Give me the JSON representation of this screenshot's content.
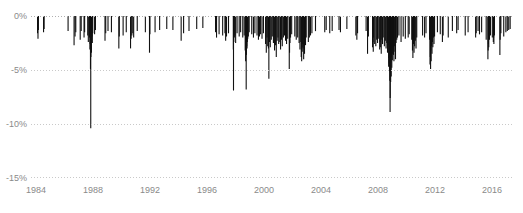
{
  "chart_data": {
    "type": "bar",
    "title": "",
    "subtitle": "",
    "xlabel": "",
    "ylabel": "",
    "xlim": [
      1983.6,
      2017.4
    ],
    "ylim": [
      -15,
      0
    ],
    "grid": true,
    "legend_position": "none",
    "orientation": "downward-spikes",
    "series_name": "Daily negative return",
    "y_ticks": [
      {
        "value": 0,
        "label": "0%"
      },
      {
        "value": -5,
        "label": "-5%"
      },
      {
        "value": -10,
        "label": "-10%"
      },
      {
        "value": -15,
        "label": "-15%"
      }
    ],
    "x_ticks": [
      {
        "value": 1984,
        "label": "1984"
      },
      {
        "value": 1988,
        "label": "1988"
      },
      {
        "value": 1992,
        "label": "1992"
      },
      {
        "value": 1996,
        "label": "1996"
      },
      {
        "value": 2000,
        "label": "2000"
      },
      {
        "value": 2004,
        "label": "2004"
      },
      {
        "value": 2008,
        "label": "2008"
      },
      {
        "value": 2012,
        "label": "2012"
      },
      {
        "value": 2016,
        "label": "2016"
      }
    ],
    "series_color": "#111111",
    "grid_color": "#c9c9c9",
    "axis_text_color": "#8a8a8a",
    "background_color": "#ffffff",
    "notable_events": [
      {
        "x": 1987.8,
        "y": -10.4,
        "label": "Black Monday 1987"
      },
      {
        "x": 2008.78,
        "y": -8.9,
        "label": "2008 financial crisis"
      }
    ],
    "points": [
      [
        1984.06,
        -1.6
      ],
      [
        1984.09,
        -2.1
      ],
      [
        1984.12,
        -1.3
      ],
      [
        1984.48,
        -1.5
      ],
      [
        1984.52,
        -1.2
      ],
      [
        1986.2,
        -1.4
      ],
      [
        1986.62,
        -2.7
      ],
      [
        1986.69,
        -1.9
      ],
      [
        1986.74,
        -1.5
      ],
      [
        1987.05,
        -2.2
      ],
      [
        1987.12,
        -1.4
      ],
      [
        1987.32,
        -2.0
      ],
      [
        1987.36,
        -1.5
      ],
      [
        1987.58,
        -1.8
      ],
      [
        1987.62,
        -2.4
      ],
      [
        1987.7,
        -2.0
      ],
      [
        1987.73,
        -3.1
      ],
      [
        1987.75,
        -2.6
      ],
      [
        1987.77,
        -4.9
      ],
      [
        1987.79,
        -10.4
      ],
      [
        1987.8,
        -3.8
      ],
      [
        1987.82,
        -2.9
      ],
      [
        1987.84,
        -3.4
      ],
      [
        1987.86,
        -2.2
      ],
      [
        1987.88,
        -1.9
      ],
      [
        1987.9,
        -2.5
      ],
      [
        1987.93,
        -1.6
      ],
      [
        1988.06,
        -1.7
      ],
      [
        1988.12,
        -1.3
      ],
      [
        1988.79,
        -2.3
      ],
      [
        1988.84,
        -1.6
      ],
      [
        1989.0,
        -1.4
      ],
      [
        1989.24,
        -1.5
      ],
      [
        1989.76,
        -3.0
      ],
      [
        1989.79,
        -1.9
      ],
      [
        1990.06,
        -1.8
      ],
      [
        1990.28,
        -1.5
      ],
      [
        1990.58,
        -3.0
      ],
      [
        1990.62,
        -2.1
      ],
      [
        1990.67,
        -1.8
      ],
      [
        1990.74,
        -1.6
      ],
      [
        1990.8,
        -2.0
      ],
      [
        1991.05,
        -1.4
      ],
      [
        1991.62,
        -1.5
      ],
      [
        1991.91,
        -3.4
      ],
      [
        1991.94,
        -1.7
      ],
      [
        1992.3,
        -1.5
      ],
      [
        1992.62,
        -1.3
      ],
      [
        1993.12,
        -1.2
      ],
      [
        1993.55,
        -1.3
      ],
      [
        1994.13,
        -2.3
      ],
      [
        1994.3,
        -1.6
      ],
      [
        1994.68,
        -1.4
      ],
      [
        1995.22,
        -1.2
      ],
      [
        1995.65,
        -1.1
      ],
      [
        1996.54,
        -1.5
      ],
      [
        1996.61,
        -2.0
      ],
      [
        1996.79,
        -1.7
      ],
      [
        1997.04,
        -1.8
      ],
      [
        1997.2,
        -1.6
      ],
      [
        1997.25,
        -2.3
      ],
      [
        1997.31,
        -1.9
      ],
      [
        1997.45,
        -1.6
      ],
      [
        1997.79,
        -3.1
      ],
      [
        1997.8,
        -6.9
      ],
      [
        1997.82,
        -2.4
      ],
      [
        1997.86,
        -2.0
      ],
      [
        1997.9,
        -1.8
      ],
      [
        1997.95,
        -2.5
      ],
      [
        1998.05,
        -1.6
      ],
      [
        1998.2,
        -1.9
      ],
      [
        1998.3,
        -1.5
      ],
      [
        1998.45,
        -2.0
      ],
      [
        1998.55,
        -1.8
      ],
      [
        1998.62,
        -3.2
      ],
      [
        1998.65,
        -4.2
      ],
      [
        1998.67,
        -2.5
      ],
      [
        1998.69,
        -6.8
      ],
      [
        1998.71,
        -3.6
      ],
      [
        1998.73,
        -2.8
      ],
      [
        1998.75,
        -3.0
      ],
      [
        1998.77,
        -2.4
      ],
      [
        1998.8,
        -2.1
      ],
      [
        1998.84,
        -1.9
      ],
      [
        1998.9,
        -1.5
      ],
      [
        1999.08,
        -1.7
      ],
      [
        1999.2,
        -2.0
      ],
      [
        1999.3,
        -1.6
      ],
      [
        1999.45,
        -1.8
      ],
      [
        1999.55,
        -2.2
      ],
      [
        1999.62,
        -1.9
      ],
      [
        1999.7,
        -1.7
      ],
      [
        1999.8,
        -2.1
      ],
      [
        1999.9,
        -1.6
      ],
      [
        2000.05,
        -2.6
      ],
      [
        2000.1,
        -3.4
      ],
      [
        2000.15,
        -2.0
      ],
      [
        2000.2,
        -2.8
      ],
      [
        2000.25,
        -3.0
      ],
      [
        2000.28,
        -5.8
      ],
      [
        2000.32,
        -2.4
      ],
      [
        2000.38,
        -2.9
      ],
      [
        2000.45,
        -2.2
      ],
      [
        2000.52,
        -1.9
      ],
      [
        2000.6,
        -2.5
      ],
      [
        2000.68,
        -3.2
      ],
      [
        2000.75,
        -2.7
      ],
      [
        2000.8,
        -3.8
      ],
      [
        2000.86,
        -2.3
      ],
      [
        2000.92,
        -2.0
      ],
      [
        2000.97,
        -2.6
      ],
      [
        2001.05,
        -2.4
      ],
      [
        2001.1,
        -3.1
      ],
      [
        2001.16,
        -2.2
      ],
      [
        2001.22,
        -2.8
      ],
      [
        2001.3,
        -2.0
      ],
      [
        2001.38,
        -1.8
      ],
      [
        2001.45,
        -2.3
      ],
      [
        2001.52,
        -2.6
      ],
      [
        2001.6,
        -2.1
      ],
      [
        2001.71,
        -4.9
      ],
      [
        2001.73,
        -3.4
      ],
      [
        2001.76,
        -2.5
      ],
      [
        2001.8,
        -2.0
      ],
      [
        2001.88,
        -1.7
      ],
      [
        2002.1,
        -1.9
      ],
      [
        2002.2,
        -2.2
      ],
      [
        2002.3,
        -2.0
      ],
      [
        2002.4,
        -2.5
      ],
      [
        2002.46,
        -3.1
      ],
      [
        2002.52,
        -2.4
      ],
      [
        2002.55,
        -3.8
      ],
      [
        2002.58,
        -4.2
      ],
      [
        2002.6,
        -2.9
      ],
      [
        2002.62,
        -3.3
      ],
      [
        2002.65,
        -2.6
      ],
      [
        2002.68,
        -3.0
      ],
      [
        2002.72,
        -4.0
      ],
      [
        2002.75,
        -2.8
      ],
      [
        2002.78,
        -3.5
      ],
      [
        2002.8,
        -2.2
      ],
      [
        2002.85,
        -2.7
      ],
      [
        2002.9,
        -2.0
      ],
      [
        2003.05,
        -2.4
      ],
      [
        2003.12,
        -2.0
      ],
      [
        2003.2,
        -1.8
      ],
      [
        2003.3,
        -1.6
      ],
      [
        2003.55,
        -1.4
      ],
      [
        2004.2,
        -1.5
      ],
      [
        2004.3,
        -1.3
      ],
      [
        2004.55,
        -1.6
      ],
      [
        2004.72,
        -1.4
      ],
      [
        2005.2,
        -1.3
      ],
      [
        2005.3,
        -1.5
      ],
      [
        2005.75,
        -1.2
      ],
      [
        2006.38,
        -1.8
      ],
      [
        2006.45,
        -2.2
      ],
      [
        2006.5,
        -1.6
      ],
      [
        2007.1,
        -1.4
      ],
      [
        2007.2,
        -3.5
      ],
      [
        2007.26,
        -1.9
      ],
      [
        2007.55,
        -2.9
      ],
      [
        2007.58,
        -2.4
      ],
      [
        2007.6,
        -3.3
      ],
      [
        2007.62,
        -2.0
      ],
      [
        2007.7,
        -2.6
      ],
      [
        2007.78,
        -2.8
      ],
      [
        2007.84,
        -2.2
      ],
      [
        2007.9,
        -2.5
      ],
      [
        2007.95,
        -2.1
      ],
      [
        2008.05,
        -3.1
      ],
      [
        2008.08,
        -2.4
      ],
      [
        2008.12,
        -2.9
      ],
      [
        2008.16,
        -3.5
      ],
      [
        2008.2,
        -2.2
      ],
      [
        2008.25,
        -2.6
      ],
      [
        2008.3,
        -2.0
      ],
      [
        2008.38,
        -2.8
      ],
      [
        2008.45,
        -2.3
      ],
      [
        2008.5,
        -3.0
      ],
      [
        2008.55,
        -2.5
      ],
      [
        2008.6,
        -3.4
      ],
      [
        2008.65,
        -2.7
      ],
      [
        2008.68,
        -4.7
      ],
      [
        2008.7,
        -3.9
      ],
      [
        2008.72,
        -4.4
      ],
      [
        2008.74,
        -5.1
      ],
      [
        2008.76,
        -6.0
      ],
      [
        2008.78,
        -8.9
      ],
      [
        2008.79,
        -7.6
      ],
      [
        2008.8,
        -5.2
      ],
      [
        2008.82,
        -6.1
      ],
      [
        2008.84,
        -4.3
      ],
      [
        2008.86,
        -5.6
      ],
      [
        2008.88,
        -3.8
      ],
      [
        2008.9,
        -4.8
      ],
      [
        2008.92,
        -3.2
      ],
      [
        2008.94,
        -4.1
      ],
      [
        2008.96,
        -3.5
      ],
      [
        2008.98,
        -2.9
      ],
      [
        2009.02,
        -3.6
      ],
      [
        2009.05,
        -4.2
      ],
      [
        2009.08,
        -2.8
      ],
      [
        2009.12,
        -3.3
      ],
      [
        2009.16,
        -4.0
      ],
      [
        2009.2,
        -2.5
      ],
      [
        2009.25,
        -2.2
      ],
      [
        2009.3,
        -2.0
      ],
      [
        2009.4,
        -1.8
      ],
      [
        2009.55,
        -2.4
      ],
      [
        2009.7,
        -1.9
      ],
      [
        2009.85,
        -2.1
      ],
      [
        2010.05,
        -2.0
      ],
      [
        2010.12,
        -1.7
      ],
      [
        2010.3,
        -2.2
      ],
      [
        2010.35,
        -3.2
      ],
      [
        2010.38,
        -3.9
      ],
      [
        2010.42,
        -2.6
      ],
      [
        2010.46,
        -3.4
      ],
      [
        2010.5,
        -2.8
      ],
      [
        2010.55,
        -2.3
      ],
      [
        2010.6,
        -3.0
      ],
      [
        2010.65,
        -2.0
      ],
      [
        2011.06,
        -1.8
      ],
      [
        2011.2,
        -2.0
      ],
      [
        2011.3,
        -1.6
      ],
      [
        2011.55,
        -2.2
      ],
      [
        2011.58,
        -4.5
      ],
      [
        2011.6,
        -3.8
      ],
      [
        2011.62,
        -4.9
      ],
      [
        2011.64,
        -3.2
      ],
      [
        2011.66,
        -4.2
      ],
      [
        2011.68,
        -2.8
      ],
      [
        2011.72,
        -3.5
      ],
      [
        2011.75,
        -2.4
      ],
      [
        2011.78,
        -2.9
      ],
      [
        2011.82,
        -2.0
      ],
      [
        2011.86,
        -2.6
      ],
      [
        2011.9,
        -1.9
      ],
      [
        2012.1,
        -1.5
      ],
      [
        2012.3,
        -1.7
      ],
      [
        2012.45,
        -2.4
      ],
      [
        2012.5,
        -1.8
      ],
      [
        2012.86,
        -2.0
      ],
      [
        2013.15,
        -1.4
      ],
      [
        2013.45,
        -1.6
      ],
      [
        2013.55,
        -1.3
      ],
      [
        2014.05,
        -1.8
      ],
      [
        2014.25,
        -1.5
      ],
      [
        2014.78,
        -2.0
      ],
      [
        2014.82,
        -1.6
      ],
      [
        2014.95,
        -1.4
      ],
      [
        2015.05,
        -1.7
      ],
      [
        2015.2,
        -1.5
      ],
      [
        2015.52,
        -2.2
      ],
      [
        2015.64,
        -4.0
      ],
      [
        2015.66,
        -3.2
      ],
      [
        2015.68,
        -2.6
      ],
      [
        2015.7,
        -2.9
      ],
      [
        2015.75,
        -2.2
      ],
      [
        2015.82,
        -1.8
      ],
      [
        2015.95,
        -2.0
      ],
      [
        2016.02,
        -2.4
      ],
      [
        2016.04,
        -2.0
      ],
      [
        2016.06,
        -2.6
      ],
      [
        2016.1,
        -1.8
      ],
      [
        2016.48,
        -3.6
      ],
      [
        2016.5,
        -2.2
      ],
      [
        2016.55,
        -1.6
      ],
      [
        2016.75,
        -1.9
      ],
      [
        2016.9,
        -1.5
      ],
      [
        2017.0,
        -1.4
      ],
      [
        2017.1,
        -1.3
      ],
      [
        2017.2,
        -1.2
      ]
    ]
  }
}
